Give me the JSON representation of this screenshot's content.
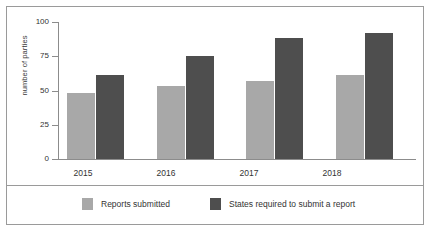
{
  "chart_data": {
    "type": "bar",
    "title": "",
    "subtitle": "",
    "xlabel": "",
    "ylabel": "number of parties",
    "categories": [
      "2015",
      "2016",
      "2017",
      "2018"
    ],
    "series": [
      {
        "name": "Reports submitted",
        "color": "#a8a8a8",
        "values": [
          48,
          53,
          57,
          61
        ]
      },
      {
        "name": "States required to submit a report",
        "color": "#4e4e4e",
        "values": [
          61,
          75,
          88,
          92
        ]
      }
    ],
    "ylim": [
      0,
      100
    ],
    "yticks": [
      "0",
      "25",
      "50",
      "75",
      "100"
    ],
    "ytick_values": [
      0,
      25,
      50,
      75,
      100
    ],
    "grid": false,
    "legend_position": "bottom"
  },
  "axes": {
    "y_label": "number of parties",
    "y_tick_labels": [
      "100",
      "75",
      "50",
      "25",
      "0"
    ],
    "x_tick_labels": [
      "2015",
      "2016",
      "2017",
      "2018"
    ]
  },
  "legend": {
    "entries": [
      {
        "label": "Reports submitted",
        "color": "#a8a8a8"
      },
      {
        "label": "States required to submit a report",
        "color": "#4e4e4e"
      }
    ]
  },
  "colors": {
    "series_light": "#a8a8a8",
    "series_dark": "#4e4e4e",
    "frame": "#9a9a9a",
    "axis": "#8c8c8c",
    "text": "#333333",
    "background": "#ffffff"
  }
}
